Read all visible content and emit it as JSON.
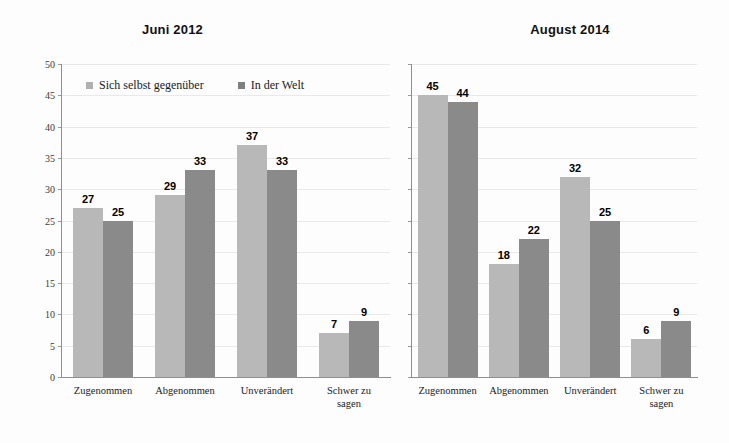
{
  "chart_data": [
    {
      "type": "bar",
      "title": "Juni 2012",
      "xlabel": "",
      "ylabel": "",
      "ylim": [
        0,
        50
      ],
      "yticks": [
        0,
        5,
        10,
        15,
        20,
        25,
        30,
        35,
        40,
        45,
        50
      ],
      "ytick_labels": [
        "0",
        "5",
        "10",
        "15",
        "20",
        "25",
        "30",
        "35",
        "40",
        "45",
        "50"
      ],
      "show_ytick_labels": true,
      "grid": true,
      "legend_position": "inside-top-left",
      "categories": [
        "Zugenommen",
        "Abgenommen",
        "Unverändert",
        "Schwer zu\nsagen"
      ],
      "series": [
        {
          "name": "Sich selbst gegenüber",
          "color": "#b8b8b8",
          "values": [
            27,
            29,
            37,
            7
          ]
        },
        {
          "name": "In der Welt",
          "color": "#8a8a8a",
          "values": [
            25,
            33,
            33,
            9
          ]
        }
      ]
    },
    {
      "type": "bar",
      "title": "August 2014",
      "xlabel": "",
      "ylabel": "",
      "ylim": [
        0,
        50
      ],
      "yticks": [
        0,
        5,
        10,
        15,
        20,
        25,
        30,
        35,
        40,
        45,
        50
      ],
      "ytick_labels": [
        "",
        "",
        "",
        "",
        "",
        "",
        "",
        "",
        "",
        "",
        ""
      ],
      "show_ytick_labels": false,
      "grid": true,
      "legend_position": "none",
      "categories": [
        "Zugenommen",
        "Abgenommen",
        "Unverändert",
        "Schwer zu\nsagen"
      ],
      "series": [
        {
          "name": "Sich selbst gegenüber",
          "color": "#b8b8b8",
          "values": [
            45,
            18,
            32,
            6
          ]
        },
        {
          "name": "In der Welt",
          "color": "#8a8a8a",
          "values": [
            44,
            22,
            25,
            9
          ]
        }
      ]
    }
  ],
  "colors": {
    "series_light": "#b8b8b8",
    "series_dark": "#8a8a8a",
    "gridline": "#e9e9e9",
    "axis": "#8f8f8f",
    "background": "#fdfdfd"
  }
}
